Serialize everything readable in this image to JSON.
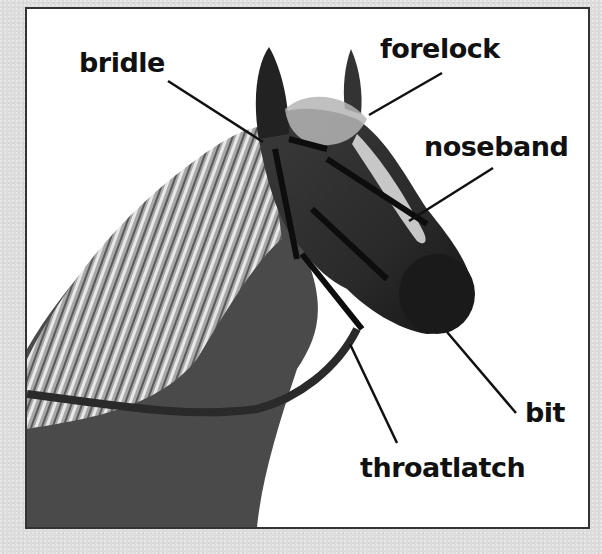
{
  "diagram": {
    "labels": [
      {
        "id": "bridle",
        "text": "bridle"
      },
      {
        "id": "forelock",
        "text": "forelock"
      },
      {
        "id": "noseband",
        "text": "noseband"
      },
      {
        "id": "bit",
        "text": "bit"
      },
      {
        "id": "throatlatch",
        "text": "throatlatch"
      }
    ]
  },
  "colors": {
    "background": "#dcdcdc",
    "frame_fill": "#ffffff",
    "frame_border": "#333333",
    "text": "#111111"
  }
}
